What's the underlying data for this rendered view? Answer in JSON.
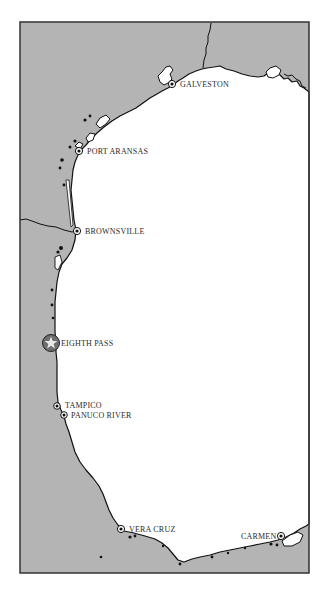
{
  "map": {
    "colors": {
      "land": "#b4b4b4",
      "water": "#ffffff",
      "coast": "#111111",
      "frame": "#333333",
      "highlight_marker_fill": "#6e6e6e",
      "marker_star": "#e8e8e8"
    },
    "places": [
      {
        "id": "galveston",
        "label": "GALVESTON",
        "x": 172,
        "y": 84,
        "type": "port"
      },
      {
        "id": "port-aransas",
        "label": "PORT ARANSAS",
        "x": 79,
        "y": 151,
        "type": "port"
      },
      {
        "id": "brownsville",
        "label": "BROWNSVILLE",
        "x": 77,
        "y": 231,
        "type": "port"
      },
      {
        "id": "eighth-pass",
        "label": "EIGHTH PASS",
        "x": 51,
        "y": 343,
        "type": "highlight"
      },
      {
        "id": "tampico",
        "label": "TAMPICO",
        "x": 57,
        "y": 406,
        "type": "port"
      },
      {
        "id": "panuco-river",
        "label": "PANUCO RIVER",
        "x": 64,
        "y": 415,
        "type": "port"
      },
      {
        "id": "vera-cruz",
        "label": "VERA CRUZ",
        "x": 121,
        "y": 529,
        "type": "port"
      },
      {
        "id": "carmen",
        "label": "CARMEN",
        "x": 281,
        "y": 536,
        "type": "port"
      }
    ]
  }
}
